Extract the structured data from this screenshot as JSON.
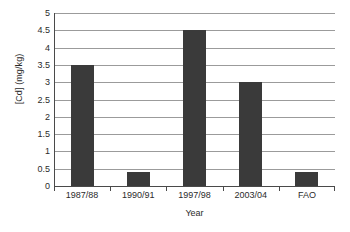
{
  "chart_data": {
    "type": "bar",
    "title": "",
    "categories": [
      "1987/88",
      "1990/91",
      "1997/98",
      "2003/04",
      "FAO"
    ],
    "values": [
      3.5,
      0.4,
      4.5,
      3.0,
      0.4
    ],
    "xlabel": "Year",
    "ylabel": "[Cd] (mg/kg)",
    "ylim": [
      0,
      5
    ],
    "ytick_labels": [
      "0",
      "0.5",
      "1",
      "1.5",
      "2",
      "2.5",
      "3",
      "3.5",
      "4",
      "4.5",
      "5"
    ],
    "ytick_values": [
      0,
      0.5,
      1,
      1.5,
      2,
      2.5,
      3,
      3.5,
      4,
      4.5,
      5
    ],
    "grid": true,
    "legend": false,
    "bar_color": "#3a3a3a",
    "grid_color": "#9b9b9b",
    "axis_color": "#4a4a4a",
    "background_color": "#ffffff"
  }
}
